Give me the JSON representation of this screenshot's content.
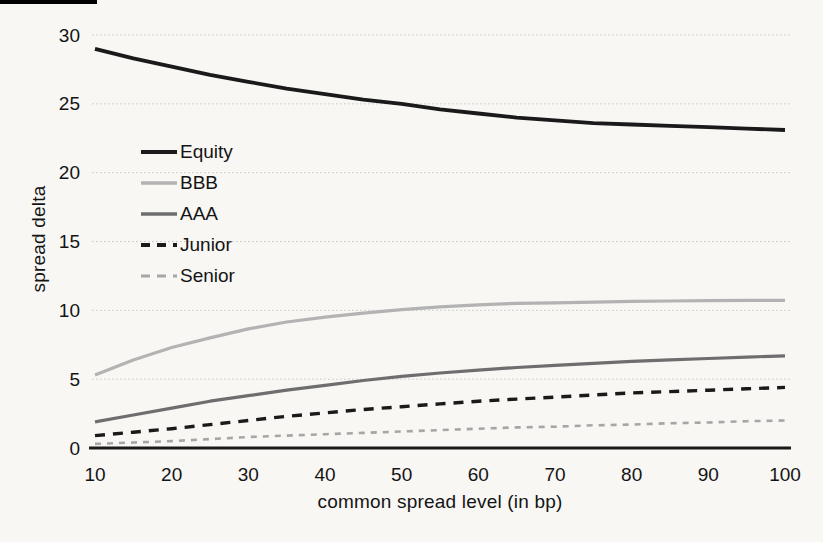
{
  "page": {
    "background": "#f8f7f4",
    "scan_mark_color": "#000000",
    "text_color": "#141414",
    "gridline_color": "#c8c8c8",
    "baseline_color": "#1a1a1a"
  },
  "chart_data": {
    "type": "line",
    "title": "",
    "xlabel": "common spread level (in bp)",
    "ylabel": "spread delta",
    "xlim": [
      10,
      100
    ],
    "ylim": [
      0,
      30
    ],
    "xticks": [
      10,
      20,
      30,
      40,
      50,
      60,
      70,
      80,
      90,
      100
    ],
    "yticks": [
      0,
      5,
      10,
      15,
      20,
      25,
      30
    ],
    "grid": true,
    "legend_position": "upper-left-inside",
    "x": [
      10,
      15,
      20,
      25,
      30,
      35,
      40,
      45,
      50,
      55,
      60,
      65,
      70,
      75,
      80,
      85,
      90,
      95,
      100
    ],
    "series": [
      {
        "name": "Equity",
        "color": "#1a1a1a",
        "width": 3.8,
        "dash": "",
        "values": [
          29.0,
          28.3,
          27.7,
          27.1,
          26.6,
          26.1,
          25.7,
          25.3,
          25.0,
          24.6,
          24.3,
          24.0,
          23.8,
          23.6,
          23.5,
          23.4,
          23.3,
          23.2,
          23.1
        ]
      },
      {
        "name": "BBB",
        "color": "#b3b3b3",
        "width": 3.2,
        "dash": "",
        "values": [
          5.3,
          6.4,
          7.3,
          8.0,
          8.65,
          9.15,
          9.5,
          9.8,
          10.05,
          10.25,
          10.4,
          10.5,
          10.55,
          10.6,
          10.65,
          10.68,
          10.7,
          10.72,
          10.73
        ]
      },
      {
        "name": "AAA",
        "color": "#6e6e6e",
        "width": 3.2,
        "dash": "",
        "values": [
          1.9,
          2.4,
          2.9,
          3.4,
          3.8,
          4.2,
          4.55,
          4.9,
          5.2,
          5.45,
          5.65,
          5.85,
          6.0,
          6.15,
          6.3,
          6.4,
          6.5,
          6.6,
          6.7
        ]
      },
      {
        "name": "Junior",
        "color": "#1a1a1a",
        "width": 3.4,
        "dash": "10 8",
        "values": [
          0.9,
          1.15,
          1.4,
          1.7,
          2.0,
          2.3,
          2.55,
          2.8,
          3.0,
          3.2,
          3.4,
          3.55,
          3.7,
          3.85,
          4.0,
          4.1,
          4.2,
          4.3,
          4.4
        ]
      },
      {
        "name": "Senior",
        "color": "#a6a6a6",
        "width": 2.6,
        "dash": "6 6",
        "values": [
          0.3,
          0.4,
          0.5,
          0.65,
          0.8,
          0.9,
          1.0,
          1.1,
          1.2,
          1.3,
          1.4,
          1.5,
          1.55,
          1.65,
          1.7,
          1.8,
          1.85,
          1.95,
          2.0
        ]
      }
    ]
  }
}
